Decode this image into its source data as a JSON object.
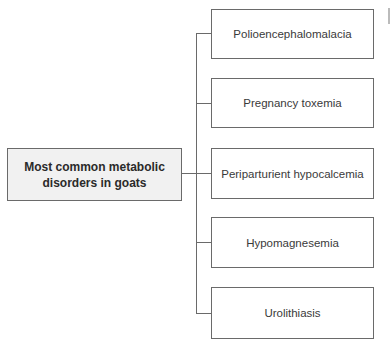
{
  "diagram": {
    "type": "tree",
    "root": {
      "label": "Most common metabolic disorders in goats",
      "line1": "Most common metabolic",
      "line2": "disorders in goats"
    },
    "children": [
      {
        "label": "Polioencephalomalacia"
      },
      {
        "label": "Pregnancy toxemia"
      },
      {
        "label": "Periparturient hypocalcemia"
      },
      {
        "label": "Hypomagnesemia"
      },
      {
        "label": "Urolithiasis"
      }
    ],
    "colors": {
      "root_fill": "#f1f1f1",
      "child_fill": "#ffffff",
      "stroke": "#6a6a6a",
      "text": "#333333"
    }
  }
}
